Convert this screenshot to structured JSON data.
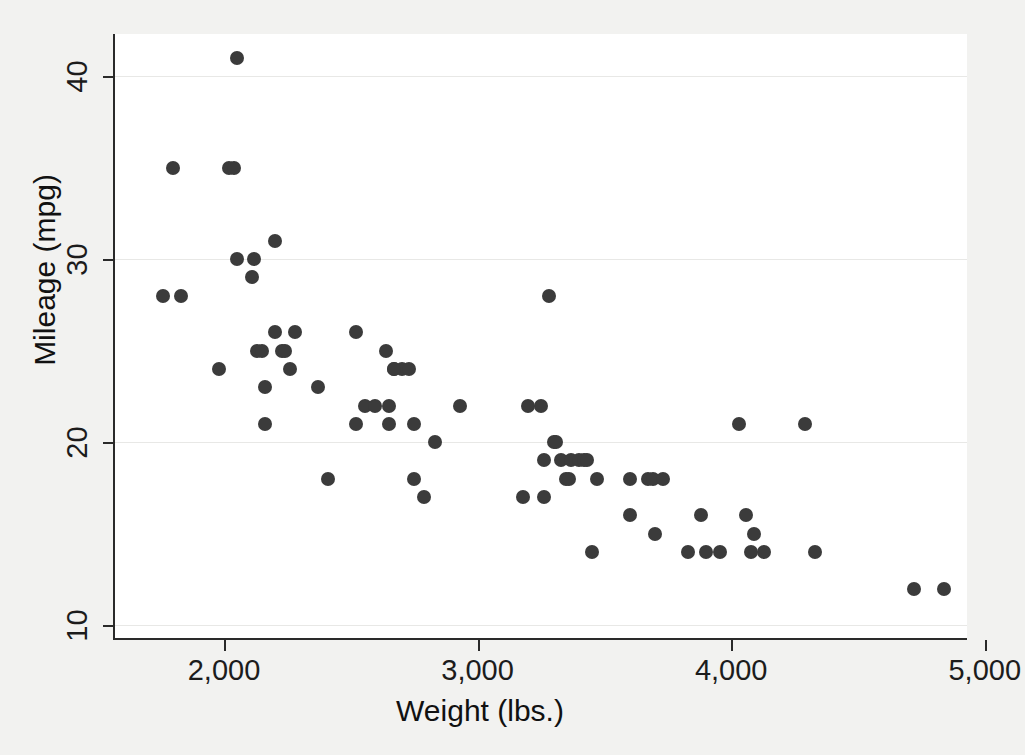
{
  "chart_data": {
    "type": "scatter",
    "title": "",
    "xlabel": "Weight (lbs.)",
    "ylabel": "Mileage (mpg)",
    "xlim": [
      1570,
      4930
    ],
    "ylim": [
      9.3,
      42.3
    ],
    "xticks": [
      2000,
      3000,
      4000,
      5000
    ],
    "xticklabels": [
      "2,000",
      "3,000",
      "4,000",
      "5,000"
    ],
    "yticks": [
      10,
      20,
      30,
      40
    ],
    "yticklabels": [
      "10",
      "20",
      "30",
      "40"
    ],
    "grid": "horizontal",
    "legend": "none",
    "marker": {
      "shape": "circle",
      "color": "#3b3b3b",
      "size_px": 14
    },
    "background": "#f2f2f0",
    "plot_background": "#ffffff",
    "n_points": 74,
    "x": [
      2930,
      3350,
      2640,
      3250,
      4080,
      3670,
      2230,
      3280,
      3880,
      3400,
      4330,
      3900,
      4290,
      4080,
      3670,
      3730,
      3470,
      2110,
      2280,
      3430,
      3600,
      3700,
      3955,
      3830,
      2200,
      2150,
      2670,
      2595,
      2700,
      2556,
      2200,
      2520,
      2830,
      3310,
      2750,
      2640,
      3450,
      2160,
      2670,
      2750,
      2120,
      2040,
      2160,
      2670,
      2370,
      3600,
      2050,
      1800,
      2200,
      1980,
      2750,
      3690,
      3180,
      3330,
      3370,
      4030,
      3370,
      4720,
      2130,
      2650,
      1760,
      2050,
      1830,
      2410,
      2200,
      2520,
      2120,
      2160,
      2370,
      2650,
      1980,
      2830,
      2200,
      4840
    ],
    "y": [
      22,
      17,
      22,
      22,
      17,
      13,
      29,
      16,
      12,
      18,
      16,
      20,
      19,
      14,
      15,
      18,
      14,
      24,
      26,
      15,
      19,
      14,
      14,
      21,
      25,
      25,
      21,
      18,
      18,
      19,
      26,
      21,
      18,
      19,
      18,
      18,
      16,
      28,
      20,
      18,
      26,
      35,
      25,
      22,
      21,
      18,
      34,
      35,
      26,
      24,
      17,
      14,
      19,
      17,
      18,
      21,
      20,
      12,
      25,
      21,
      28,
      41,
      28,
      18,
      26,
      24,
      24,
      24,
      22,
      22,
      24,
      20,
      29,
      12
    ],
    "points": [
      {
        "x": 1760,
        "y": 28
      },
      {
        "x": 1800,
        "y": 35
      },
      {
        "x": 1830,
        "y": 28
      },
      {
        "x": 1980,
        "y": 24
      },
      {
        "x": 2020,
        "y": 35
      },
      {
        "x": 2040,
        "y": 35
      },
      {
        "x": 2050,
        "y": 41
      },
      {
        "x": 2050,
        "y": 30
      },
      {
        "x": 2110,
        "y": 29
      },
      {
        "x": 2120,
        "y": 30
      },
      {
        "x": 2130,
        "y": 25
      },
      {
        "x": 2150,
        "y": 25
      },
      {
        "x": 2160,
        "y": 23
      },
      {
        "x": 2200,
        "y": 31
      },
      {
        "x": 2200,
        "y": 26
      },
      {
        "x": 2230,
        "y": 25
      },
      {
        "x": 2240,
        "y": 25
      },
      {
        "x": 2260,
        "y": 24
      },
      {
        "x": 2280,
        "y": 26
      },
      {
        "x": 2370,
        "y": 23
      },
      {
        "x": 2410,
        "y": 18
      },
      {
        "x": 2520,
        "y": 26
      },
      {
        "x": 2556,
        "y": 22
      },
      {
        "x": 2595,
        "y": 22
      },
      {
        "x": 2640,
        "y": 25
      },
      {
        "x": 2650,
        "y": 22
      },
      {
        "x": 2650,
        "y": 21
      },
      {
        "x": 2670,
        "y": 24
      },
      {
        "x": 2700,
        "y": 24
      },
      {
        "x": 2730,
        "y": 24
      },
      {
        "x": 2750,
        "y": 21
      },
      {
        "x": 2790,
        "y": 17
      },
      {
        "x": 2830,
        "y": 20
      },
      {
        "x": 2930,
        "y": 22
      },
      {
        "x": 3180,
        "y": 17
      },
      {
        "x": 3200,
        "y": 22
      },
      {
        "x": 3250,
        "y": 22
      },
      {
        "x": 3260,
        "y": 19
      },
      {
        "x": 3280,
        "y": 28
      },
      {
        "x": 3300,
        "y": 20
      },
      {
        "x": 3310,
        "y": 20
      },
      {
        "x": 3330,
        "y": 19
      },
      {
        "x": 3350,
        "y": 18
      },
      {
        "x": 3360,
        "y": 18
      },
      {
        "x": 3370,
        "y": 19
      },
      {
        "x": 3400,
        "y": 19
      },
      {
        "x": 3420,
        "y": 19
      },
      {
        "x": 3430,
        "y": 19
      },
      {
        "x": 3450,
        "y": 14
      },
      {
        "x": 3470,
        "y": 18
      },
      {
        "x": 3600,
        "y": 18
      },
      {
        "x": 3600,
        "y": 16
      },
      {
        "x": 3670,
        "y": 18
      },
      {
        "x": 3690,
        "y": 18
      },
      {
        "x": 3700,
        "y": 15
      },
      {
        "x": 3730,
        "y": 18
      },
      {
        "x": 3830,
        "y": 14
      },
      {
        "x": 3880,
        "y": 16
      },
      {
        "x": 3900,
        "y": 14
      },
      {
        "x": 3955,
        "y": 14
      },
      {
        "x": 4030,
        "y": 21
      },
      {
        "x": 4060,
        "y": 16
      },
      {
        "x": 4080,
        "y": 14
      },
      {
        "x": 4090,
        "y": 15
      },
      {
        "x": 4130,
        "y": 14
      },
      {
        "x": 4290,
        "y": 21
      },
      {
        "x": 4330,
        "y": 14
      },
      {
        "x": 4720,
        "y": 12
      },
      {
        "x": 4840,
        "y": 12
      },
      {
        "x": 2520,
        "y": 21
      },
      {
        "x": 2670,
        "y": 24
      },
      {
        "x": 2160,
        "y": 21
      },
      {
        "x": 2750,
        "y": 18
      },
      {
        "x": 3260,
        "y": 17
      }
    ]
  }
}
